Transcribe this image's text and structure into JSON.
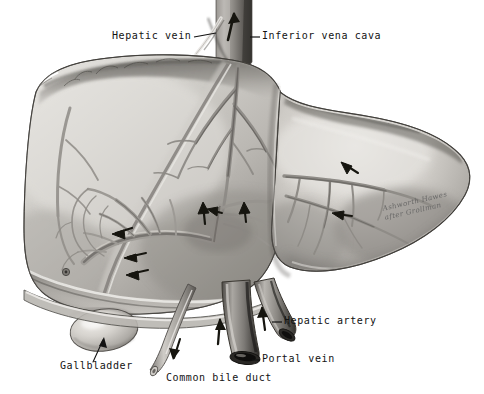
{
  "figure": {
    "background_color": "#ffffff",
    "ink_color": "#131313",
    "width": 484,
    "height": 394
  },
  "labels": [
    {
      "id": "hepatic-vein",
      "text": "Hepatic vein",
      "x": 112,
      "y": 36,
      "leader": "right"
    },
    {
      "id": "inferior-vena-cava",
      "text": "Inferior vena cava",
      "x": 262,
      "y": 36,
      "leader": "left"
    },
    {
      "id": "hepatic-artery",
      "text": "Hepatic artery",
      "x": 284,
      "y": 322,
      "leader": "left"
    },
    {
      "id": "portal-vein",
      "text": "Portal vein",
      "x": 262,
      "y": 360,
      "leader": "left"
    },
    {
      "id": "common-bile-duct",
      "text": "Common bile duct",
      "x": 166,
      "y": 379,
      "leader": "none"
    },
    {
      "id": "gallbladder",
      "text": "Gallbladder",
      "x": 60,
      "y": 367,
      "leader": "none"
    }
  ],
  "signature": {
    "line1": "Ashworth Hawes",
    "line2": "after Grollman",
    "x": 382,
    "y": 206
  },
  "anatomy": {
    "organ": "liver",
    "lobes": [
      "right lobe",
      "left lobe"
    ],
    "vessels": [
      "inferior vena cava",
      "hepatic vein",
      "hepatic artery",
      "portal vein",
      "common bile duct"
    ],
    "structures": [
      "gallbladder",
      "falciform ligament",
      "bare area"
    ],
    "flow_arrows": 11,
    "style": "grayscale airbrush medical illustration"
  },
  "palette": {
    "paper": "#ffffff",
    "tissue_light": "#d8d6d2",
    "tissue_mid": "#b4b1ac",
    "tissue_dark": "#8a8782",
    "tissue_shadow": "#5e5b57",
    "vessel": "#9b9893",
    "vessel_dark": "#56534f",
    "lumen": "#1d1c1b",
    "outline": "#3a3835"
  }
}
